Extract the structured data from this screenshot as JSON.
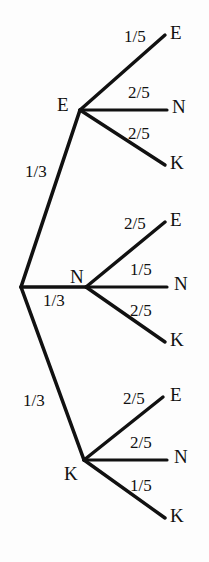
{
  "diagram": {
    "type": "probability-tree",
    "background_color": "#fdfdfd",
    "line_color": "#111111",
    "text_color": "#111111",
    "levels": 2,
    "root": {
      "label": "",
      "x": 21,
      "y": 287
    },
    "branches": [
      {
        "id": "branch-e",
        "label": "E",
        "probability": "1/3",
        "node": {
          "x": 80,
          "y": 110
        },
        "node_label_x": 57,
        "node_label_y": 95,
        "prob_label_x": 25,
        "prob_label_y": 163,
        "children": [
          {
            "id": "leaf-e-e",
            "label": "E",
            "probability": "1/5",
            "end": {
              "x": 165,
              "y": 35
            },
            "letter_x": 170,
            "letter_y": 23,
            "prob_label_x": 124,
            "prob_label_y": 28
          },
          {
            "id": "leaf-e-n",
            "label": "N",
            "probability": "2/5",
            "end": {
              "x": 167,
              "y": 110
            },
            "letter_x": 172,
            "letter_y": 97,
            "prob_label_x": 128,
            "prob_label_y": 84
          },
          {
            "id": "leaf-e-k",
            "label": "K",
            "probability": "2/5",
            "end": {
              "x": 165,
              "y": 165
            },
            "letter_x": 170,
            "letter_y": 153,
            "prob_label_x": 128,
            "prob_label_y": 125
          }
        ]
      },
      {
        "id": "branch-n",
        "label": "N",
        "probability": "1/3",
        "node": {
          "x": 86,
          "y": 287
        },
        "node_label_x": 70,
        "node_label_y": 267,
        "prob_label_x": 43,
        "prob_label_y": 292,
        "children": [
          {
            "id": "leaf-n-e",
            "label": "E",
            "probability": "2/5",
            "end": {
              "x": 165,
              "y": 222
            },
            "letter_x": 170,
            "letter_y": 210,
            "prob_label_x": 124,
            "prob_label_y": 215
          },
          {
            "id": "leaf-n-n",
            "label": "N",
            "probability": "1/5",
            "end": {
              "x": 167,
              "y": 287
            },
            "letter_x": 174,
            "letter_y": 274,
            "prob_label_x": 130,
            "prob_label_y": 261
          },
          {
            "id": "leaf-n-k",
            "label": "K",
            "probability": "2/5",
            "end": {
              "x": 165,
              "y": 342
            },
            "letter_x": 170,
            "letter_y": 330,
            "prob_label_x": 130,
            "prob_label_y": 302
          }
        ]
      },
      {
        "id": "branch-k",
        "label": "K",
        "probability": "1/3",
        "node": {
          "x": 84,
          "y": 460
        },
        "node_label_x": 64,
        "node_label_y": 464,
        "prob_label_x": 23,
        "prob_label_y": 392,
        "children": [
          {
            "id": "leaf-k-e",
            "label": "E",
            "probability": "2/5",
            "end": {
              "x": 163,
              "y": 397
            },
            "letter_x": 170,
            "letter_y": 385,
            "prob_label_x": 123,
            "prob_label_y": 390
          },
          {
            "id": "leaf-k-n",
            "label": "N",
            "probability": "2/5",
            "end": {
              "x": 167,
              "y": 460
            },
            "letter_x": 174,
            "letter_y": 447,
            "prob_label_x": 130,
            "prob_label_y": 434
          },
          {
            "id": "leaf-k-k",
            "label": "K",
            "probability": "1/5",
            "end": {
              "x": 165,
              "y": 518
            },
            "letter_x": 170,
            "letter_y": 506,
            "prob_label_x": 130,
            "prob_label_y": 477
          }
        ]
      }
    ]
  }
}
